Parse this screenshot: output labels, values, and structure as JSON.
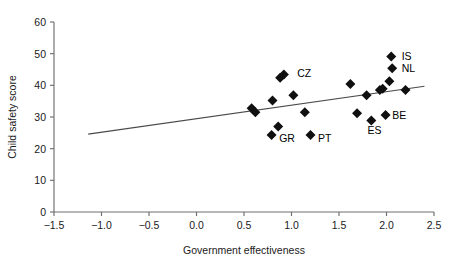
{
  "chart_data": {
    "type": "scatter",
    "title": "",
    "xlabel": "Government effectiveness",
    "ylabel": "Child safety score",
    "xlim": [
      -1.5,
      2.5
    ],
    "ylim": [
      0,
      60
    ],
    "xticks": [
      "−1.5",
      "−1.0",
      "−0.5",
      "0.0",
      "0.5",
      "1.0",
      "1.5",
      "2.0",
      "2.5"
    ],
    "xtick_values": [
      -1.5,
      -1.0,
      -0.5,
      0.0,
      0.5,
      1.0,
      1.5,
      2.0,
      2.5
    ],
    "yticks": [
      "0",
      "10",
      "20",
      "30",
      "40",
      "50",
      "60"
    ],
    "ytick_values": [
      0,
      10,
      20,
      30,
      40,
      50,
      60
    ],
    "grid": false,
    "legend": "none",
    "marker": "diamond",
    "marker_color": "#101010",
    "trendline": {
      "shown": true,
      "x_start": -1.14,
      "y_start": 24.6,
      "x_end": 2.4,
      "y_end": 39.7,
      "color": "#4a4a4a"
    },
    "points": [
      {
        "x": 0.58,
        "y": 32.8,
        "label": ""
      },
      {
        "x": 0.62,
        "y": 31.5,
        "label": ""
      },
      {
        "x": 0.8,
        "y": 35.2,
        "label": ""
      },
      {
        "x": 0.86,
        "y": 27.0,
        "label": ""
      },
      {
        "x": 0.88,
        "y": 42.4,
        "label": ""
      },
      {
        "x": 0.92,
        "y": 43.4,
        "label": "CZ"
      },
      {
        "x": 0.79,
        "y": 24.3,
        "label": "GR"
      },
      {
        "x": 1.02,
        "y": 36.9,
        "label": ""
      },
      {
        "x": 1.14,
        "y": 31.5,
        "label": ""
      },
      {
        "x": 1.2,
        "y": 24.3,
        "label": "PT"
      },
      {
        "x": 1.62,
        "y": 40.4,
        "label": ""
      },
      {
        "x": 1.69,
        "y": 31.2,
        "label": ""
      },
      {
        "x": 1.79,
        "y": 36.9,
        "label": ""
      },
      {
        "x": 1.84,
        "y": 28.9,
        "label": "ES"
      },
      {
        "x": 1.93,
        "y": 38.5,
        "label": ""
      },
      {
        "x": 1.96,
        "y": 38.9,
        "label": ""
      },
      {
        "x": 1.99,
        "y": 30.6,
        "label": "BE"
      },
      {
        "x": 2.03,
        "y": 41.3,
        "label": ""
      },
      {
        "x": 2.05,
        "y": 49.1,
        "label": "IS"
      },
      {
        "x": 2.06,
        "y": 45.4,
        "label": "NL"
      },
      {
        "x": 2.2,
        "y": 38.5,
        "label": ""
      }
    ],
    "annotations": [
      {
        "text": "CZ",
        "x": 1.06,
        "y": 44.0
      },
      {
        "text": "IS",
        "x": 2.16,
        "y": 49.4
      },
      {
        "text": "NL",
        "x": 2.16,
        "y": 45.6
      },
      {
        "text": "GR",
        "x": 0.87,
        "y": 23.3
      },
      {
        "text": "PT",
        "x": 1.28,
        "y": 23.4
      },
      {
        "text": "ES",
        "x": 1.8,
        "y": 25.8
      },
      {
        "text": "BE",
        "x": 2.06,
        "y": 30.6
      }
    ]
  }
}
